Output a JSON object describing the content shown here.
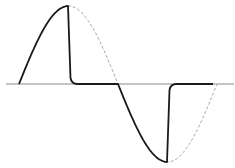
{
  "diagram": {
    "title": "",
    "colors": {
      "background": "#ffffff",
      "axis": "#8a8a8a",
      "solid_wave": "#1a1a1a",
      "dashed_wave": "#a8a8a8"
    },
    "axis": {
      "x1": 6,
      "x2": 234,
      "y": 84
    },
    "wave": {
      "start_x": 19,
      "period_half": 99,
      "amplitude": 78,
      "baseline_y": 84,
      "cut_angle_deg": 90
    }
  }
}
